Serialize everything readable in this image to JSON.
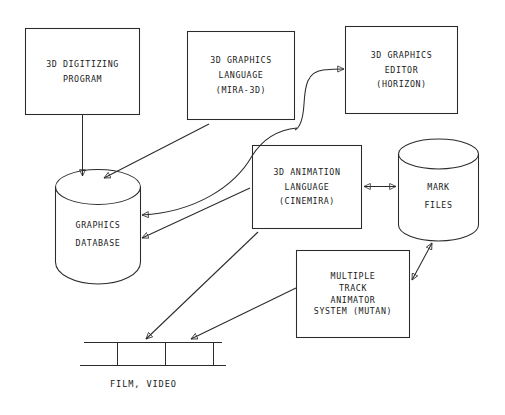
{
  "diagram": {
    "stroke_color": "#2b2b2b",
    "background_color": "#ffffff",
    "nodes": [
      {
        "id": "digitizing",
        "shape": "rectangle",
        "lines": [
          "3D DIGITIZING",
          "PROGRAM"
        ]
      },
      {
        "id": "graphics-language",
        "shape": "rectangle",
        "lines": [
          "3D GRAPHICS",
          "LANGUAGE",
          "(MIRA-3D)"
        ]
      },
      {
        "id": "graphics-editor",
        "shape": "rectangle",
        "lines": [
          "3D GRAPHICS",
          "EDITOR",
          "(HORIZON)"
        ]
      },
      {
        "id": "animation-language",
        "shape": "rectangle",
        "lines": [
          "3D ANIMATION",
          "LANGUAGE",
          "(CINEMIRA)"
        ]
      },
      {
        "id": "mutan",
        "shape": "rectangle",
        "lines": [
          "MULTIPLE",
          "TRACK",
          "ANIMATOR",
          "SYSTEM (MUTAN)"
        ]
      },
      {
        "id": "graphics-database",
        "shape": "cylinder",
        "lines": [
          "GRAPHICS",
          "DATABASE"
        ]
      },
      {
        "id": "mark-files",
        "shape": "cylinder",
        "lines": [
          "MARK",
          "FILES"
        ]
      },
      {
        "id": "film-video",
        "shape": "filmstrip",
        "lines": [
          "FILM, VIDEO"
        ]
      }
    ],
    "edges": [
      {
        "from": "digitizing",
        "to": "graphics-database",
        "style": "straight",
        "arrow": "single"
      },
      {
        "from": "graphics-language",
        "to": "graphics-editor",
        "style": "curved-s",
        "arrow": "single"
      },
      {
        "from": "graphics-database",
        "to": "graphics-language",
        "style": "straight",
        "arrow": "single"
      },
      {
        "from": "graphics-language",
        "to": "graphics-database",
        "style": "curved",
        "arrow": "single"
      },
      {
        "from": "graphics-database",
        "to": "animation-language",
        "style": "straight",
        "arrow": "single"
      },
      {
        "from": "animation-language",
        "to": "graphics-database",
        "style": "straight",
        "arrow": "single"
      },
      {
        "from": "animation-language",
        "to": "mark-files",
        "style": "straight",
        "arrow": "double"
      },
      {
        "from": "mutan",
        "to": "mark-files",
        "style": "straight",
        "arrow": "double"
      },
      {
        "from": "animation-language",
        "to": "film-video",
        "style": "straight",
        "arrow": "single"
      },
      {
        "from": "mutan",
        "to": "film-video",
        "style": "straight",
        "arrow": "single"
      }
    ]
  }
}
